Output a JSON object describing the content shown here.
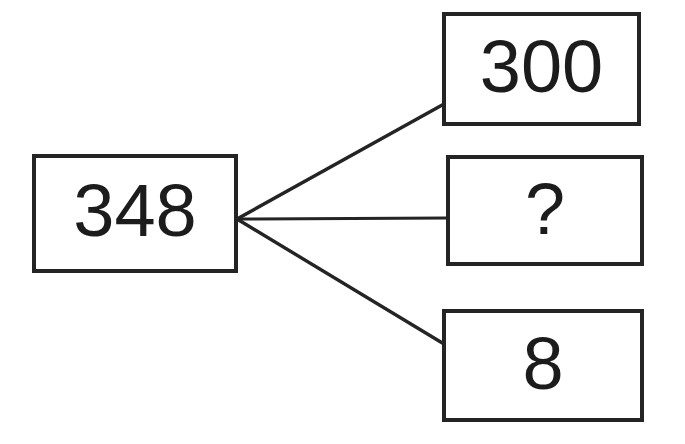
{
  "diagram": {
    "type": "number-bond-branch-diagram",
    "canvas": {
      "width": 685,
      "height": 444,
      "background": "#ffffff"
    },
    "stroke_color": "#242424",
    "text_color": "#1c1c1c",
    "nodes": {
      "root": {
        "label": "348",
        "name": "root-number-box",
        "x": 32,
        "y": 154,
        "width": 206,
        "height": 119
      },
      "hundreds": {
        "label": "300",
        "name": "hundreds-part-box",
        "x": 442,
        "y": 12,
        "width": 199,
        "height": 114
      },
      "unknown": {
        "label": "?",
        "name": "unknown-part-box",
        "x": 446,
        "y": 155,
        "width": 198,
        "height": 111
      },
      "ones": {
        "label": "8",
        "name": "ones-part-box",
        "x": 442,
        "y": 309,
        "width": 202,
        "height": 113
      }
    },
    "connectors": [
      {
        "name": "connector-to-hundreds",
        "from_x": 237,
        "from_y": 219,
        "to_x": 444,
        "to_y": 104
      },
      {
        "name": "connector-to-unknown",
        "from_x": 237,
        "from_y": 219,
        "to_x": 448,
        "to_y": 218
      },
      {
        "name": "connector-to-ones",
        "from_x": 237,
        "from_y": 219,
        "to_x": 444,
        "to_y": 344
      }
    ],
    "connector_width": 3.4,
    "vertex": {
      "x": 237,
      "y": 219
    }
  }
}
